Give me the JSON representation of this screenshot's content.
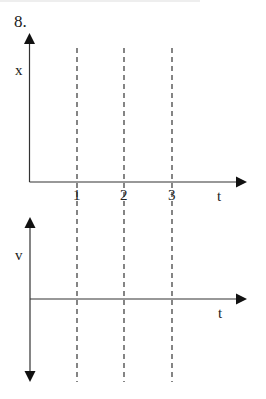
{
  "problem": {
    "number": "8."
  },
  "graphs": [
    {
      "name": "position-time",
      "y_label": "x",
      "x_label": "t",
      "ticks": [
        "1",
        "2",
        "3"
      ]
    },
    {
      "name": "velocity-time",
      "y_label": "v",
      "x_label": "t"
    }
  ],
  "colors": {
    "axis": "#333333",
    "dashed": "#444444",
    "text": "#222222"
  }
}
